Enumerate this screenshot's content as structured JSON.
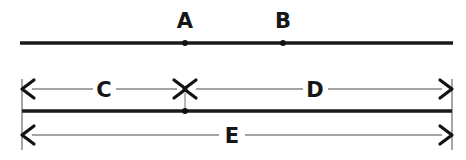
{
  "diagram": {
    "type": "line-segment-diagram",
    "background_color": "#ffffff",
    "line_color": "#1a1a1a",
    "dimension_color": "#4a4a4a",
    "label_color": "#161616",
    "top_segment": {
      "name": "top-line",
      "x_start": 20,
      "x_end": 453,
      "y": 43,
      "points": [
        {
          "label": "A",
          "x": 185,
          "label_x": 185,
          "label_y": 26
        },
        {
          "label": "B",
          "x": 283,
          "label_x": 283,
          "label_y": 26
        }
      ]
    },
    "bottom_segment": {
      "name": "bottom-line",
      "x_start": 22,
      "x_end": 452,
      "y": 111,
      "points": [
        {
          "label": "",
          "x": 185
        }
      ]
    },
    "dimensions": [
      {
        "label": "C",
        "name": "dimension-c",
        "y": 89,
        "x_start": 22,
        "x_end": 185,
        "label_x": 104,
        "label_y": 97,
        "arrow_start": "left",
        "arrow_end": "right"
      },
      {
        "label": "D",
        "name": "dimension-d",
        "y": 89,
        "x_start": 185,
        "x_end": 452,
        "label_x": 315,
        "label_y": 97,
        "arrow_start": "left",
        "arrow_end": "right"
      },
      {
        "label": "E",
        "name": "dimension-e",
        "y": 135,
        "x_start": 22,
        "x_end": 452,
        "label_x": 232,
        "label_y": 143,
        "arrow_start": "left",
        "arrow_end": "right"
      }
    ],
    "extension_lines": [
      {
        "name": "extension-left",
        "x": 22,
        "y_top": 79,
        "y_bottom": 150
      },
      {
        "name": "extension-right",
        "x": 452,
        "y_top": 79,
        "y_bottom": 150
      },
      {
        "name": "extension-center",
        "x": 185,
        "y_top": 93,
        "y_bottom": 110
      }
    ],
    "labels": {
      "point_a": "A",
      "point_b": "B",
      "dim_c": "C",
      "dim_d": "D",
      "dim_e": "E"
    }
  }
}
